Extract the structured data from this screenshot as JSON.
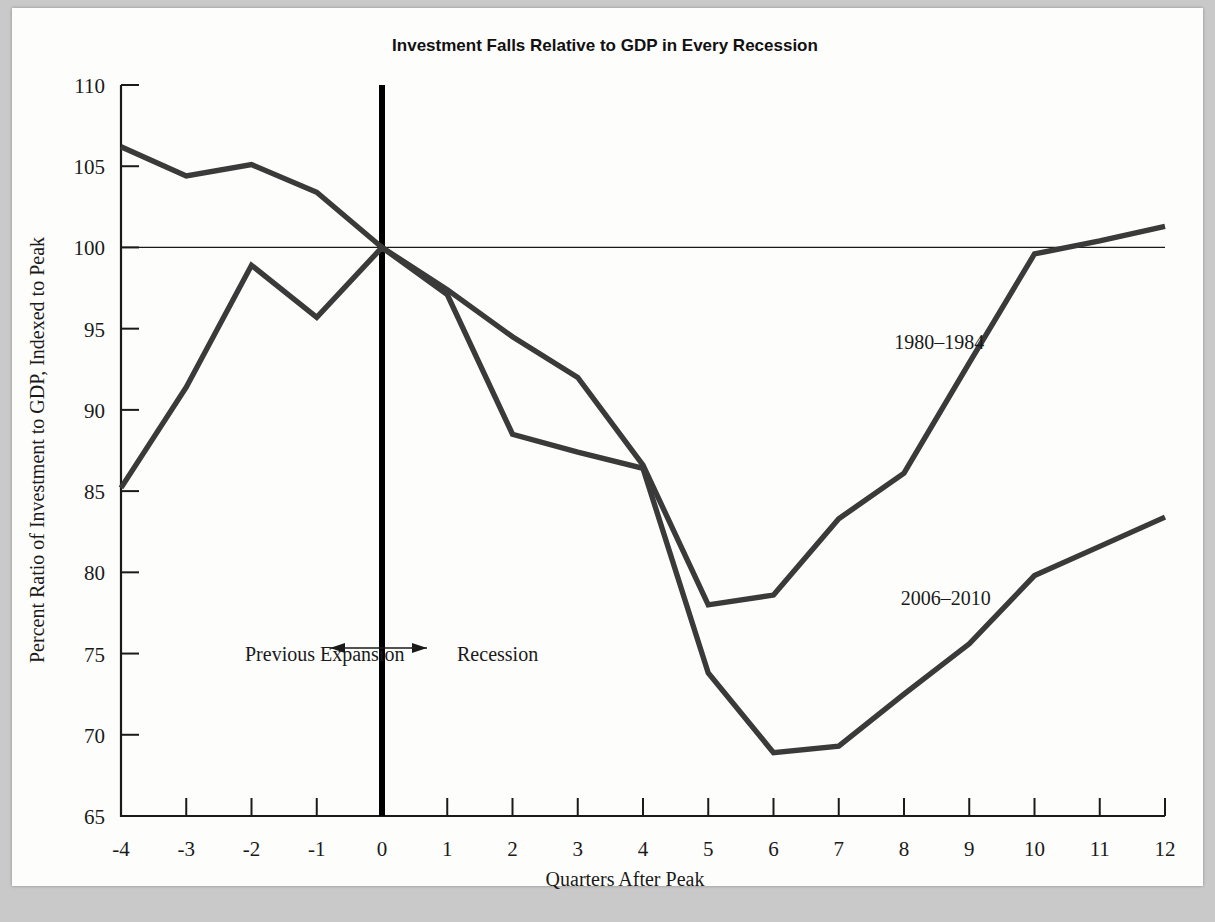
{
  "chart_data": {
    "type": "line",
    "title": "Investment Falls Relative to GDP in Every Recession",
    "xlabel": "Quarters After Peak",
    "ylabel": "Percent Ratio of Investment to GDP, Indexed to Peak",
    "x": [
      -4,
      -3,
      -2,
      -1,
      0,
      1,
      2,
      3,
      4,
      5,
      6,
      7,
      8,
      9,
      10,
      11,
      12
    ],
    "xticklabels": [
      "-4",
      "-3",
      "-2",
      "-1",
      "0",
      "1",
      "2",
      "3",
      "4",
      "5",
      "6",
      "7",
      "8",
      "9",
      "10",
      "11",
      "12"
    ],
    "yticklabels": [
      "65",
      "70",
      "75",
      "80",
      "85",
      "90",
      "95",
      "100",
      "105",
      "110"
    ],
    "yticks": [
      65,
      70,
      75,
      80,
      85,
      90,
      95,
      100,
      105,
      110
    ],
    "xlim": [
      -4,
      12
    ],
    "ylim": [
      65,
      110
    ],
    "grid": false,
    "legend_position": "inline-annotation",
    "series": [
      {
        "name": "1980-1984",
        "label": "1980–1984",
        "color": "#3a3a3a",
        "values": [
          106.2,
          104.4,
          105.1,
          103.4,
          100.0,
          97.4,
          94.5,
          92.0,
          86.6,
          78.0,
          78.6,
          83.3,
          86.1,
          92.9,
          99.6,
          100.4,
          101.3
        ]
      },
      {
        "name": "2006-2010",
        "label": "2006–2010",
        "color": "#3a3a3a",
        "values": [
          85.2,
          91.4,
          98.9,
          95.7,
          100.0,
          97.1,
          88.5,
          87.4,
          86.4,
          73.8,
          68.9,
          69.3,
          72.5,
          75.6,
          79.8,
          81.6,
          83.4
        ]
      }
    ],
    "annotations": [
      {
        "name": "previous-expansion",
        "text": "Previous Expansion",
        "x": -2.1,
        "y": 75.0
      },
      {
        "name": "recession",
        "text": "Recession",
        "x": 1.15,
        "y": 75.0
      },
      {
        "name": "series-label-1980",
        "text": "1980–1984",
        "x": 7.85,
        "y": 94.2
      },
      {
        "name": "series-label-2006",
        "text": "2006–2010",
        "x": 7.95,
        "y": 78.4
      }
    ],
    "reference_lines": [
      {
        "name": "peak-index-line",
        "orientation": "horizontal",
        "value": 100
      },
      {
        "name": "peak-quarter-line",
        "orientation": "vertical",
        "value": 0
      }
    ],
    "colors": {
      "page_background": "#c9c9c9",
      "sheet_background": "#fdfdfb",
      "ink": "#1a1a1a",
      "series_line": "#3a3a3a",
      "peak_line": "#000000"
    }
  }
}
